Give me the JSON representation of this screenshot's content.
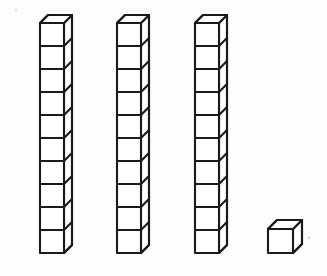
{
  "figure": {
    "background_color": "#fdfdfd",
    "line_color": "#1a1a1a",
    "face_color": "#ffffff",
    "total_value": 31
  },
  "geometry": {
    "cube_width": 24,
    "cube_height": 23,
    "depth_x": 8,
    "depth_y": 8,
    "single_cube_width": 25,
    "single_cube_height": 24,
    "single_depth_x": 9,
    "single_depth_y": 9
  },
  "groups": [
    {
      "name": "rod-1",
      "label": "Ten rod 1",
      "kind": "ten-rod",
      "count": 10,
      "value": 10,
      "x": 40,
      "bottom_y": 253
    },
    {
      "name": "rod-2",
      "label": "Ten rod 2",
      "kind": "ten-rod",
      "count": 10,
      "value": 10,
      "x": 117,
      "bottom_y": 253
    },
    {
      "name": "rod-3",
      "label": "Ten rod 3",
      "kind": "ten-rod",
      "count": 10,
      "value": 10,
      "x": 195,
      "bottom_y": 253
    },
    {
      "name": "unit-cube-1",
      "label": "Unit cube",
      "kind": "unit-cube",
      "count": 1,
      "value": 1,
      "x": 268,
      "bottom_y": 253
    }
  ],
  "specks": [
    {
      "cx": 309,
      "cy": 238,
      "r": 1.4
    },
    {
      "cx": 16,
      "cy": 10,
      "r": 1.1
    }
  ],
  "chart_data": {
    "type": "bar",
    "categories": [
      "Ten rod 1",
      "Ten rod 2",
      "Ten rod 3",
      "Unit cube"
    ],
    "values": [
      10,
      10,
      10,
      1
    ],
    "xlabel": "",
    "ylabel": "Unit cubes",
    "ylim": [
      0,
      10
    ]
  }
}
